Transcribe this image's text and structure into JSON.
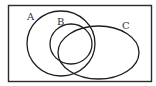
{
  "diagram": {
    "type": "venn",
    "universe": {
      "x": 8.5,
      "y": 5.5,
      "width": 143,
      "height": 76,
      "stroke": "#2b2b2b"
    },
    "sets": [
      {
        "id": "A",
        "label": "A",
        "shape": "ellipse",
        "cx": 61,
        "cy": 43.5,
        "rx": 34,
        "ry": 32.5,
        "label_x": 27,
        "label_y": 20
      },
      {
        "id": "B",
        "label": "B",
        "shape": "ellipse",
        "cx": 71,
        "cy": 44,
        "rx": 21,
        "ry": 20,
        "label_x": 57,
        "label_y": 25
      },
      {
        "id": "C",
        "label": "C",
        "shape": "ellipse",
        "cx": 98.5,
        "cy": 52.5,
        "rx": 40.5,
        "ry": 26.5,
        "label_x": 122,
        "label_y": 29
      }
    ],
    "stroke_color": "#1e1e1e",
    "label_color": "#333333"
  }
}
